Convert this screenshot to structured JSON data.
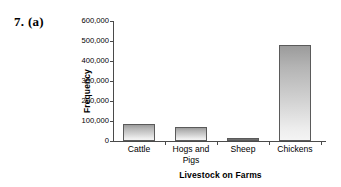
{
  "problem": {
    "label": "7. (a)"
  },
  "chart_data": {
    "type": "bar",
    "title": "",
    "xlabel": "Livestock on Farms",
    "ylabel": "Frequency",
    "categories": [
      "Cattle",
      "Hogs and\nPigs",
      "Sheep",
      "Chickens"
    ],
    "values": [
      85000,
      68000,
      10000,
      478000
    ],
    "ylim": [
      0,
      600000
    ],
    "ytick_values": [
      0,
      100000,
      200000,
      300000,
      400000,
      500000,
      600000
    ],
    "ytick_labels": [
      "0",
      "100,000",
      "200,000",
      "300,000",
      "400,000",
      "500,000",
      "600,000"
    ],
    "grid": false,
    "legend": false,
    "bar_fill_top": "#9b9b9b",
    "bar_fill_bottom": "#f4f4f4",
    "bar_border": "#5a5a5a",
    "axis_color": "#4a4a4a"
  }
}
